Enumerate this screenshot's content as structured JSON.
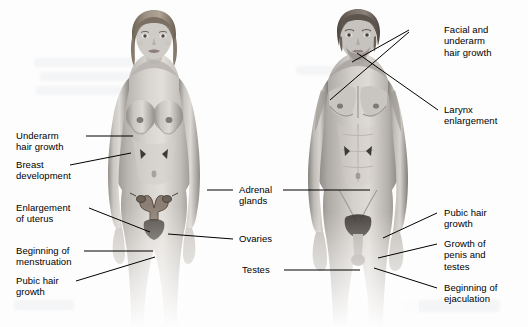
{
  "diagram": {
    "background_color": "#fdfdfd",
    "text_color": "#000000",
    "leader_color": "#000000",
    "figures": [
      {
        "id": "female-figure",
        "name": "female-body-illustration",
        "side": "left"
      },
      {
        "id": "male-figure",
        "name": "male-body-illustration",
        "side": "right"
      }
    ],
    "labels_left": [
      {
        "id": "underarm-hair-growth",
        "text": "Underarm\nhair growth"
      },
      {
        "id": "breast-development",
        "text": "Breast\ndevelopment"
      },
      {
        "id": "enlargement-of-uterus",
        "text": "Enlargement\nof uterus"
      },
      {
        "id": "beginning-of-menstruation",
        "text": "Beginning of\nmenstruation"
      },
      {
        "id": "pubic-hair-growth-female",
        "text": "Pubic hair\ngrowth"
      }
    ],
    "labels_center": [
      {
        "id": "adrenal-glands",
        "text": "Adrenal\nglands"
      },
      {
        "id": "ovaries",
        "text": "Ovaries"
      },
      {
        "id": "testes",
        "text": "Testes"
      }
    ],
    "labels_right": [
      {
        "id": "facial-and-underarm-hair-growth",
        "text": "Facial and\nunderarm\nhair growth"
      },
      {
        "id": "larynx-enlargement",
        "text": "Larynx\nenlargement"
      },
      {
        "id": "pubic-hair-growth-male",
        "text": "Pubic hair\ngrowth"
      },
      {
        "id": "growth-of-penis-and-testes",
        "text": "Growth of\npenis and\ntestes"
      },
      {
        "id": "beginning-of-ejaculation",
        "text": "Beginning of\nejaculation"
      }
    ]
  }
}
